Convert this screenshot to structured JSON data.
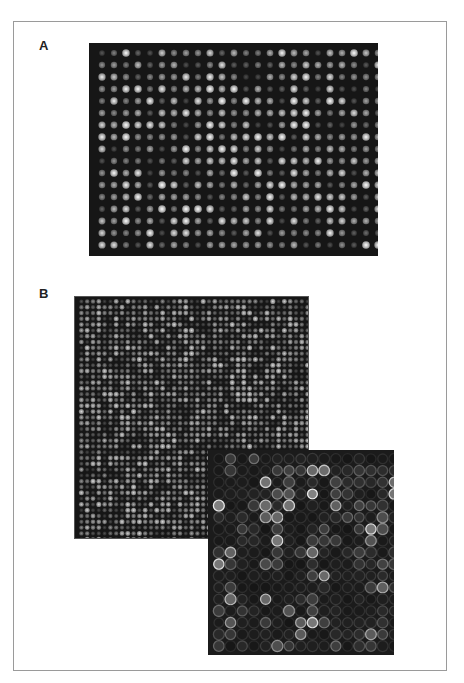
{
  "figure": {
    "labels": {
      "a": "A",
      "b": "B"
    },
    "frame_color": "#9a9a9a",
    "panels": {
      "a": {
        "description": "microarray scan, uniform filled spots",
        "cols": 24,
        "rows": 17,
        "pitch": 12,
        "spot_radius": 3.2,
        "offset_x": 7,
        "offset_y": 6,
        "seed": 11,
        "style": "filled",
        "background": "#161616"
      },
      "b_main": {
        "description": "high-density microarray scan",
        "cols": 40,
        "rows": 42,
        "pitch": 5.8,
        "spot_radius": 2.3,
        "offset_x": 3.5,
        "offset_y": 3.5,
        "seed": 27,
        "style": "filled",
        "background": "#161616"
      },
      "b_inset": {
        "description": "magnified region of microarray, ring-shaped spots",
        "cols": 16,
        "rows": 17,
        "pitch": 11.7,
        "spot_radius": 4.8,
        "offset_x": 5,
        "offset_y": 5,
        "seed": 53,
        "style": "ring",
        "background": "#1b1b1b"
      }
    }
  }
}
